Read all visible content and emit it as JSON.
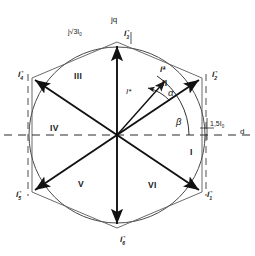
{
  "figure": {
    "type": "space-vector-hexagon",
    "center": {
      "x": 117,
      "y": 135
    },
    "radius_px": 93
  },
  "axes": {
    "imaginary_label": "jq",
    "real_label": "d",
    "imaginary_magnitude": "j√3I",
    "imaginary_magnitude_sub": "0",
    "real_magnitude": "1,5I",
    "real_magnitude_sub": "0"
  },
  "vectors": [
    {
      "name": "I",
      "sub": "1",
      "angle_deg": -60,
      "label_x": 207,
      "label_y": 191
    },
    {
      "name": "I",
      "sub": "2",
      "angle_deg": 0,
      "label_x": 212,
      "label_y": 71
    },
    {
      "name": "I",
      "sub": "3",
      "angle_deg": 90,
      "label_x": 124,
      "label_y": 30
    },
    {
      "name": "I",
      "sub": "4",
      "angle_deg": 180,
      "label_x": 18,
      "label_y": 71
    },
    {
      "name": "I",
      "sub": "5",
      "angle_deg": 240,
      "label_x": 16,
      "label_y": 191
    },
    {
      "name": "I",
      "sub": "6",
      "angle_deg": 270,
      "label_x": 120,
      "label_y": 236
    }
  ],
  "sectors": [
    {
      "label": "I",
      "x": 190,
      "y": 148
    },
    {
      "label": "II",
      "x": 162,
      "y": 79
    },
    {
      "label": "III",
      "x": 74,
      "y": 72
    },
    {
      "label": "IV",
      "x": 50,
      "y": 124
    },
    {
      "label": "V",
      "x": 78,
      "y": 180
    },
    {
      "label": "VI",
      "x": 148,
      "y": 181
    }
  ],
  "reference_vector": {
    "arrow_label": "I*",
    "inline_label": "I*",
    "angle_deg": 48,
    "magnitude_px": 72
  },
  "angles": [
    {
      "symbol": "α",
      "x": 168,
      "y": 93
    },
    {
      "symbol": "β",
      "x": 176,
      "y": 122
    }
  ],
  "style": {
    "stroke": "#1a1a1a",
    "circle_stroke": "#3a3a3a",
    "dash_stroke": "#2a2a2a"
  }
}
